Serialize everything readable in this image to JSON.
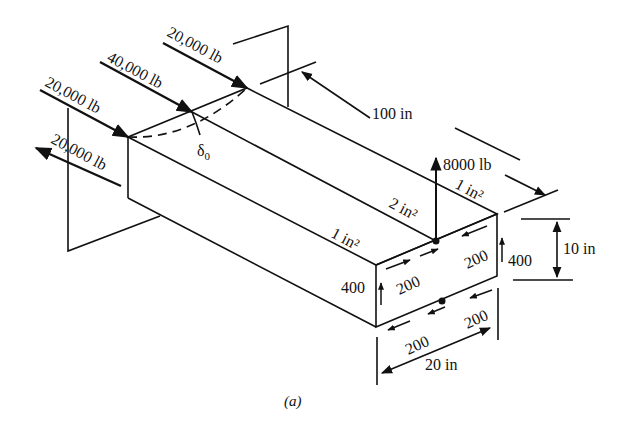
{
  "figure": {
    "caption": "(a)",
    "loads": {
      "top_back": "20,000 lb",
      "top_middle": "40,000 lb",
      "top_front": "20,000 lb",
      "bottom": "20,000 lb",
      "vertical": "8000 lb"
    },
    "dimensions": {
      "length": "100 in",
      "height": "10 in",
      "width": "20 in"
    },
    "areas": {
      "top_right_flange": "1 in²",
      "top_middle_flange": "2 in²",
      "top_left_flange": "1 in²"
    },
    "deflection_symbol": "δ",
    "deflection_subscript": "0",
    "shear_flows": {
      "left_web": "400",
      "right_web": "400",
      "top_left": "200",
      "top_right": "200",
      "bottom_left": "200",
      "bottom_right": "200"
    },
    "colors": {
      "ink": "#111111",
      "background": "#ffffff"
    }
  }
}
